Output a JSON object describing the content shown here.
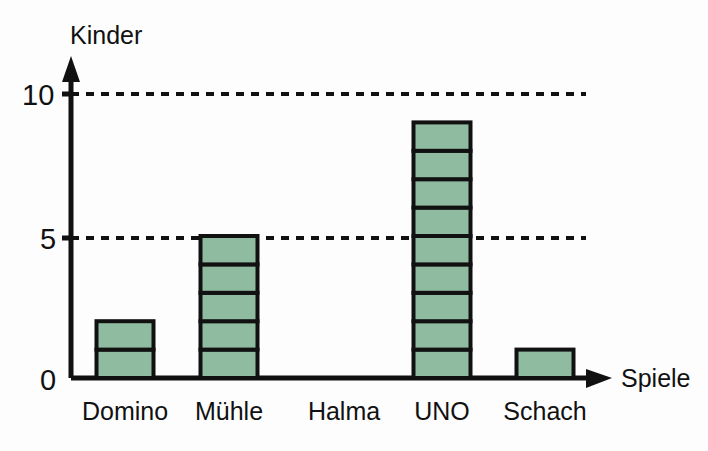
{
  "chart_data": {
    "type": "bar",
    "title": "",
    "subtitle": "",
    "xlabel": "Spiele",
    "ylabel": "Kinder",
    "categories": [
      "Domino",
      "Mühle",
      "Halma",
      "UNO",
      "Schach"
    ],
    "values": [
      2,
      5,
      0,
      9,
      1
    ],
    "series": [
      {
        "name": "Kinder",
        "values": [
          2,
          5,
          0,
          9,
          1
        ]
      }
    ],
    "ylim": [
      0,
      11
    ],
    "xlim": [
      0,
      5
    ],
    "y_ticks": [
      0,
      5,
      10
    ],
    "y_tick_labels": [
      "0",
      "5",
      "10"
    ],
    "gridlines": {
      "horizontal_dashed_at": [
        5,
        10
      ],
      "vertical": false,
      "grid_on": true,
      "style": "dashed"
    },
    "legend": {
      "visible": false,
      "position": "none",
      "entries": []
    },
    "annotations": [],
    "bar_style": {
      "segmented": true,
      "segment_unit": 1,
      "fill_color": "#8FBCA0",
      "border_color": "#111111"
    },
    "axis_style": {
      "arrow_heads": true,
      "axis_color": "#111111"
    }
  },
  "labels": {
    "y_axis_title": "Kinder",
    "x_axis_title": "Spiele",
    "tick_10": "10",
    "tick_5": "5",
    "tick_0": "0",
    "cat_domino": "Domino",
    "cat_muehle": "Mühle",
    "cat_halma": "Halma",
    "cat_uno": "UNO",
    "cat_schach": "Schach"
  },
  "colors": {
    "bar_fill": "#8FBCA0",
    "bar_stroke": "#111111",
    "axis": "#111111",
    "grid": "#111111",
    "background": "#fdfdfd"
  }
}
